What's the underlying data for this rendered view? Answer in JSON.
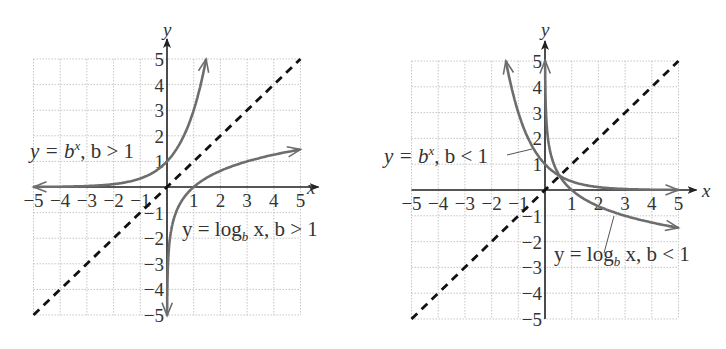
{
  "chart_data": [
    {
      "type": "line",
      "title": "",
      "xlabel": "x",
      "ylabel": "y",
      "xlim": [
        -5,
        5
      ],
      "ylim": [
        -5,
        5
      ],
      "grid": true,
      "x_ticks": [
        "−5",
        "−4",
        "−3",
        "−2",
        "−1",
        "1",
        "2",
        "3",
        "4",
        "5"
      ],
      "y_ticks": [
        "5",
        "4",
        "3",
        "2",
        "1",
        "−1",
        "−2",
        "−3",
        "−4",
        "−5"
      ],
      "series": [
        {
          "name": "y = b^x, b > 1",
          "style": "solid",
          "base": 3,
          "x": [
            -5,
            -4,
            -3,
            -2,
            -1,
            0,
            0.5,
            1,
            1.465
          ],
          "y": [
            0.004,
            0.012,
            0.037,
            0.111,
            0.333,
            1,
            1.732,
            3,
            5
          ]
        },
        {
          "name": "y = log_b x, b > 1",
          "style": "solid",
          "base": 3,
          "x": [
            0.004,
            0.012,
            0.037,
            0.111,
            0.333,
            1,
            2,
            3,
            4,
            5
          ],
          "y": [
            -5,
            -4,
            -3,
            -2,
            -1,
            0,
            0.631,
            1,
            1.262,
            1.465
          ]
        },
        {
          "name": "y = x",
          "style": "dashed",
          "x": [
            -5,
            5
          ],
          "y": [
            -5,
            5
          ]
        }
      ],
      "annotations": [
        {
          "text_parts": [
            "y = b",
            "x",
            ", b > 1"
          ],
          "target": "exponential"
        },
        {
          "text_parts": [
            "y = log",
            "b",
            " x, b > 1"
          ],
          "target": "logarithm"
        }
      ]
    },
    {
      "type": "line",
      "title": "",
      "xlabel": "x",
      "ylabel": "y",
      "xlim": [
        -5,
        5
      ],
      "ylim": [
        -5,
        5
      ],
      "grid": true,
      "x_ticks": [
        "−5",
        "−4",
        "−3",
        "−2",
        "−1",
        "1",
        "2",
        "3",
        "4",
        "5"
      ],
      "y_ticks": [
        "5",
        "4",
        "3",
        "2",
        "1",
        "−1",
        "−2",
        "−3",
        "−4",
        "−5"
      ],
      "series": [
        {
          "name": "y = b^x, b < 1",
          "style": "solid",
          "base": 0.333,
          "x": [
            -1.465,
            -1,
            -0.5,
            0,
            1,
            2,
            3,
            4,
            5
          ],
          "y": [
            5,
            3,
            1.732,
            1,
            0.333,
            0.111,
            0.037,
            0.012,
            0.004
          ]
        },
        {
          "name": "y = log_b x, b < 1",
          "style": "solid",
          "base": 0.333,
          "x": [
            0.004,
            0.012,
            0.037,
            0.111,
            0.333,
            1,
            2,
            3,
            4,
            5
          ],
          "y": [
            5,
            4,
            3,
            2,
            1,
            0,
            -0.631,
            -1,
            -1.262,
            -1.465
          ]
        },
        {
          "name": "y = x",
          "style": "dashed",
          "x": [
            -5,
            5
          ],
          "y": [
            -5,
            5
          ]
        }
      ],
      "annotations": [
        {
          "text_parts": [
            "y = b",
            "x",
            ", b < 1"
          ],
          "target": "exponential"
        },
        {
          "text_parts": [
            "y = log",
            "b",
            " x, b < 1"
          ],
          "target": "logarithm"
        }
      ]
    }
  ],
  "labels": {
    "axis_x": "x",
    "axis_y": "y",
    "left": {
      "exp": {
        "pre": "y = b",
        "sup": "x",
        "post": ", b > 1"
      },
      "log": {
        "pre": "y = log",
        "sub": "b",
        "post": " x, b > 1"
      }
    },
    "right": {
      "exp": {
        "pre": "y = b",
        "sup": "x",
        "post": ", b < 1"
      },
      "log": {
        "pre": "y = log",
        "sub": "b",
        "post": " x, b < 1"
      }
    }
  }
}
